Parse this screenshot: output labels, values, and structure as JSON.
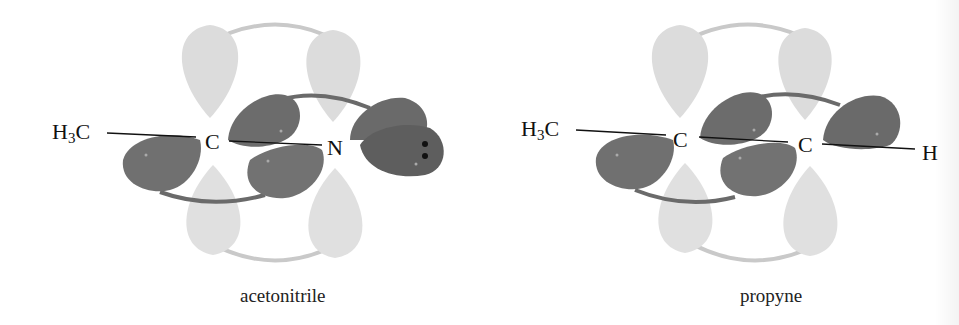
{
  "figure": {
    "background": "#ffffff",
    "colors": {
      "sigma_lobe_dark": "#6e6e6e",
      "pi_lobe_light": "#dcdcdc",
      "pi_connector": "#c9c9c9",
      "sigma_connector": "#6a6a6a",
      "bond_line": "#111111",
      "lone_pair_dots": "#111111"
    },
    "panels": [
      {
        "caption": "acetonitrile",
        "atoms": {
          "methyl_main": "H",
          "methyl_sub": "3",
          "methyl_tail": "C",
          "center_carbon": "C",
          "nitrogen": "N"
        },
        "lone_pair": "••"
      },
      {
        "caption": "propyne",
        "atoms": {
          "methyl_main": "H",
          "methyl_sub": "3",
          "methyl_tail": "C",
          "carbon_1": "C",
          "carbon_2": "C",
          "hydrogen": "H"
        }
      }
    ]
  }
}
